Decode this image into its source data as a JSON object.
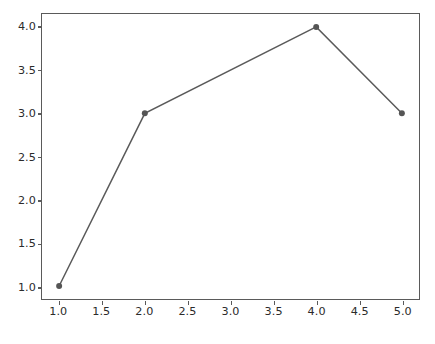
{
  "figure": {
    "background_color": "#ffffff",
    "caption": ""
  },
  "chart_data": {
    "type": "line",
    "title": "",
    "xlabel": "",
    "ylabel": "",
    "x": [
      1,
      2,
      4,
      5
    ],
    "values": [
      1.0,
      3.0,
      4.0,
      3.0
    ],
    "series": [
      {
        "name": "",
        "x": [
          1,
          2,
          4,
          5
        ],
        "values": [
          1.0,
          3.0,
          4.0,
          3.0
        ]
      }
    ],
    "xlim": [
      0.8,
      5.2
    ],
    "ylim": [
      0.85,
      4.15
    ],
    "xticks": [
      1.0,
      1.5,
      2.0,
      2.5,
      3.0,
      3.5,
      4.0,
      4.5,
      5.0
    ],
    "xtick_labels": [
      "1.0",
      "1.5",
      "2.0",
      "2.5",
      "3.0",
      "3.5",
      "4.0",
      "4.5",
      "5.0"
    ],
    "yticks": [
      1.0,
      1.5,
      2.0,
      2.5,
      3.0,
      3.5,
      4.0
    ],
    "ytick_labels": [
      "1.0",
      "1.5",
      "2.0",
      "2.5",
      "3.0",
      "3.5",
      "4.0"
    ],
    "grid": false,
    "legend": null,
    "legend_position": "none",
    "marker": "circle",
    "marker_size": 6,
    "line_width": 1.5,
    "line_color": "#5a5a5a",
    "marker_color": "#555555",
    "axis_color": "#5a5a5a",
    "tick_label_color": "#2b2b2b"
  }
}
